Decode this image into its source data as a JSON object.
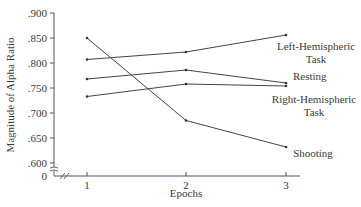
{
  "chart_data": {
    "type": "line",
    "title": "",
    "xlabel": "Epochs",
    "ylabel": "Magnitude of Alpha Ratio",
    "x": [
      1,
      2,
      3
    ],
    "x_tick_labels": [
      "1",
      "2",
      "3"
    ],
    "y_tick_labels": [
      ".900",
      ".850",
      ".800",
      ".750",
      ".700",
      ".650",
      ".600",
      "0"
    ],
    "ylim": [
      0.6,
      0.9
    ],
    "y_axis_break": true,
    "grid": false,
    "legend": "inline-annotations-right",
    "series": [
      {
        "name": "Left-Hemispheric Task",
        "values": [
          0.807,
          0.822,
          0.856
        ]
      },
      {
        "name": "Resting",
        "values": [
          0.768,
          0.786,
          0.76
        ]
      },
      {
        "name": "Right-Hemispheric Task",
        "values": [
          0.733,
          0.758,
          0.754
        ]
      },
      {
        "name": "Shooting",
        "values": [
          0.85,
          0.685,
          0.632
        ]
      }
    ]
  },
  "labels": {
    "left_line1": "Left-Hemispheric",
    "left_line2": "Task",
    "resting": "Resting",
    "right_line1": "Right-Hemispheric",
    "right_line2": "Task",
    "shooting": "Shooting"
  }
}
